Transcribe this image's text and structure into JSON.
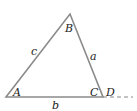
{
  "diagram": {
    "type": "triangle",
    "vertices": [
      {
        "id": "A",
        "label": "A"
      },
      {
        "id": "B",
        "label": "B"
      },
      {
        "id": "C",
        "label": "C"
      }
    ],
    "sides": [
      {
        "id": "a",
        "label": "a",
        "between": [
          "B",
          "C"
        ]
      },
      {
        "id": "b",
        "label": "b",
        "between": [
          "A",
          "C"
        ]
      },
      {
        "id": "c",
        "label": "c",
        "between": [
          "A",
          "B"
        ]
      }
    ],
    "extension": {
      "label": "D",
      "style": "dashed",
      "from": "C"
    },
    "colors": {
      "line": "#8a8a8a",
      "text": "#222222"
    }
  }
}
